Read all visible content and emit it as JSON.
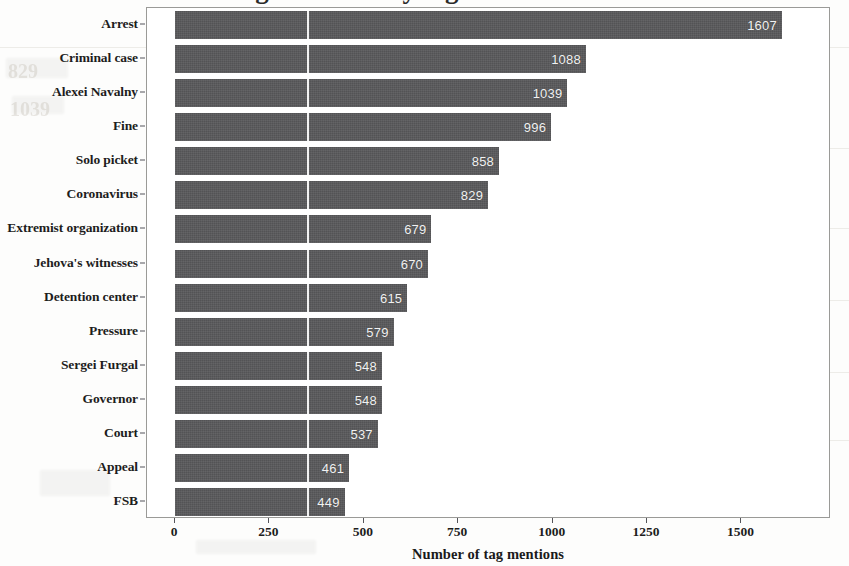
{
  "figure": {
    "cut_off_title": "Number of tag mentions by tag",
    "bar_color": "#59595b",
    "value_label_color": "#f2f2f2",
    "axis_color": "#55555a",
    "background_color": "#ffffff"
  },
  "chart_data": {
    "type": "bar",
    "orientation": "horizontal",
    "title": "",
    "xlabel": "Number of tag mentions",
    "ylabel": "",
    "categories": [
      "Arrest",
      "Criminal case",
      "Alexei Navalny",
      "Fine",
      "Solo picket",
      "Coronavirus",
      "Extremist organization",
      "Jehova's witnesses",
      "Detention center",
      "Pressure",
      "Sergei Furgal",
      "Governor",
      "Court",
      "Appeal",
      "FSB"
    ],
    "values": [
      1607,
      1088,
      1039,
      996,
      858,
      829,
      679,
      670,
      615,
      579,
      548,
      548,
      537,
      461,
      449
    ],
    "data_labels": [
      "1607",
      "1088",
      "1039",
      "996",
      "858",
      "829",
      "679",
      "670",
      "615",
      "579",
      "548",
      "548",
      "537",
      "461",
      "449"
    ],
    "xlim": [
      0,
      1700
    ],
    "xticks": [
      0,
      250,
      500,
      750,
      1000,
      1250,
      1500
    ],
    "xtick_labels": [
      "0",
      "250",
      "500",
      "750",
      "1000",
      "1250",
      "1500"
    ],
    "grid": false,
    "legend": null
  },
  "artifacts": {
    "ghost_text_1": "829",
    "ghost_text_2": "1039"
  }
}
